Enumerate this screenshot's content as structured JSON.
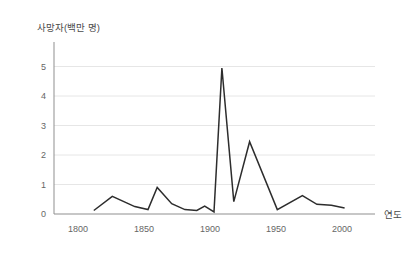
{
  "chart": {
    "y_axis_title": "사망자(백만 명)",
    "x_axis_title": "연도"
  },
  "chart_data": {
    "type": "line",
    "title": "",
    "xlabel": "연도",
    "ylabel": "사망자(백만 명)",
    "x_ticks": [
      1800,
      1850,
      1900,
      1950,
      2000
    ],
    "y_ticks": [
      0,
      1,
      2,
      3,
      4,
      5
    ],
    "xlim": [
      1782,
      2026
    ],
    "ylim": [
      0,
      5
    ],
    "grid": "horizontal-only",
    "legend": "none",
    "colors": {
      "line": "#2d2d2d",
      "axis": "#8f8f8f",
      "grid": "#e6e6e6",
      "tick_label": "#666666"
    },
    "series_name": "deaths-millions-by-year",
    "points": [
      [
        1812,
        0.12
      ],
      [
        1826,
        0.6
      ],
      [
        1843,
        0.25
      ],
      [
        1853,
        0.15
      ],
      [
        1860,
        0.9
      ],
      [
        1871,
        0.35
      ],
      [
        1881,
        0.15
      ],
      [
        1890,
        0.12
      ],
      [
        1896,
        0.27
      ],
      [
        1903,
        0.07
      ],
      [
        1909,
        4.95
      ],
      [
        1918,
        0.42
      ],
      [
        1930,
        2.45
      ],
      [
        1951,
        0.15
      ],
      [
        1970,
        0.62
      ],
      [
        1981,
        0.33
      ],
      [
        1992,
        0.3
      ],
      [
        2002,
        0.2
      ]
    ]
  }
}
